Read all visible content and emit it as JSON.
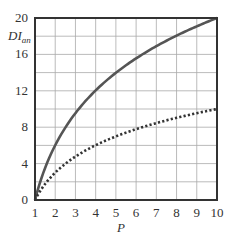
{
  "chart_data": {
    "type": "line",
    "title": "",
    "xlabel": "P",
    "ylabel": "DI",
    "ylabel_subscript": "an",
    "xlim": [
      1,
      10
    ],
    "ylim": [
      0,
      20
    ],
    "grid": true,
    "x_ticks": [
      "1",
      "2",
      "3",
      "4",
      "5",
      "6",
      "7",
      "8",
      "9",
      "10"
    ],
    "y_ticks": [
      "0",
      "4",
      "8",
      "12",
      "16",
      "20"
    ],
    "x": [
      1,
      2,
      3,
      4,
      5,
      6,
      7,
      8,
      9,
      10
    ],
    "series": [
      {
        "name": "solid",
        "style": "solid",
        "color": "#555555",
        "values": [
          0,
          6.0,
          9.5,
          12.0,
          14.0,
          15.6,
          16.9,
          18.1,
          19.1,
          20.0
        ]
      },
      {
        "name": "dotted",
        "style": "dotted",
        "color": "#333333",
        "values": [
          0,
          3.0,
          4.8,
          6.0,
          7.0,
          7.8,
          8.5,
          9.0,
          9.5,
          10.0
        ]
      }
    ],
    "legend": null
  }
}
